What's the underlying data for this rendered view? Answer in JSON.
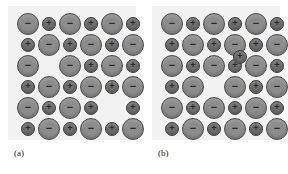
{
  "figure": {
    "background_color": "#ffffff",
    "panel_background_color": "#f2f2f2",
    "anion_color": "#8c8c8c",
    "anion_border_color": "#4a4a4a",
    "cation_color": "#6e6e6e",
    "cation_border_color": "#3d3d3d"
  },
  "legend": {
    "anion_symbol": "−",
    "cation_symbol": "+",
    "anion_name": "anion",
    "cation_name": "cation"
  },
  "panels": [
    {
      "caption": "(a)",
      "defect_type": "Schottky defect",
      "grid": {
        "columns": 6,
        "rows": 6,
        "x_start": 20,
        "x_step": 21,
        "y_start": 18,
        "y_step": 21
      },
      "vacancies": [
        {
          "row": 3,
          "col": 2,
          "missing": "cation"
        },
        {
          "row": 5,
          "col": 5,
          "missing": "anion"
        }
      ],
      "interstitials": [],
      "ions": [
        {
          "row": 1,
          "col": 1,
          "type": "anion",
          "sign": "−"
        },
        {
          "row": 1,
          "col": 2,
          "type": "cation",
          "sign": "+"
        },
        {
          "row": 1,
          "col": 3,
          "type": "anion",
          "sign": "−"
        },
        {
          "row": 1,
          "col": 4,
          "type": "cation",
          "sign": "+"
        },
        {
          "row": 1,
          "col": 5,
          "type": "anion",
          "sign": "−"
        },
        {
          "row": 1,
          "col": 6,
          "type": "cation",
          "sign": "+"
        },
        {
          "row": 2,
          "col": 1,
          "type": "cation",
          "sign": "+"
        },
        {
          "row": 2,
          "col": 2,
          "type": "anion",
          "sign": "−"
        },
        {
          "row": 2,
          "col": 3,
          "type": "cation",
          "sign": "+"
        },
        {
          "row": 2,
          "col": 4,
          "type": "anion",
          "sign": "−"
        },
        {
          "row": 2,
          "col": 5,
          "type": "cation",
          "sign": "+"
        },
        {
          "row": 2,
          "col": 6,
          "type": "anion",
          "sign": "−"
        },
        {
          "row": 3,
          "col": 1,
          "type": "anion",
          "sign": "−"
        },
        {
          "row": 3,
          "col": 3,
          "type": "anion",
          "sign": "−"
        },
        {
          "row": 3,
          "col": 4,
          "type": "cation",
          "sign": "+"
        },
        {
          "row": 3,
          "col": 5,
          "type": "anion",
          "sign": "−"
        },
        {
          "row": 3,
          "col": 6,
          "type": "cation",
          "sign": "+"
        },
        {
          "row": 4,
          "col": 1,
          "type": "cation",
          "sign": "+"
        },
        {
          "row": 4,
          "col": 2,
          "type": "anion",
          "sign": "−"
        },
        {
          "row": 4,
          "col": 3,
          "type": "cation",
          "sign": "+"
        },
        {
          "row": 4,
          "col": 4,
          "type": "anion",
          "sign": "−"
        },
        {
          "row": 4,
          "col": 5,
          "type": "cation",
          "sign": "+"
        },
        {
          "row": 4,
          "col": 6,
          "type": "anion",
          "sign": "−"
        },
        {
          "row": 5,
          "col": 1,
          "type": "anion",
          "sign": "−"
        },
        {
          "row": 5,
          "col": 2,
          "type": "cation",
          "sign": "+"
        },
        {
          "row": 5,
          "col": 3,
          "type": "anion",
          "sign": "−"
        },
        {
          "row": 5,
          "col": 4,
          "type": "cation",
          "sign": "+"
        },
        {
          "row": 5,
          "col": 6,
          "type": "cation",
          "sign": "+"
        },
        {
          "row": 6,
          "col": 1,
          "type": "cation",
          "sign": "+"
        },
        {
          "row": 6,
          "col": 2,
          "type": "anion",
          "sign": "−"
        },
        {
          "row": 6,
          "col": 3,
          "type": "cation",
          "sign": "+"
        },
        {
          "row": 6,
          "col": 4,
          "type": "anion",
          "sign": "−"
        },
        {
          "row": 6,
          "col": 5,
          "type": "cation",
          "sign": "+"
        },
        {
          "row": 6,
          "col": 6,
          "type": "anion",
          "sign": "−"
        }
      ]
    },
    {
      "caption": "(b)",
      "defect_type": "Frenkel defect",
      "grid": {
        "columns": 6,
        "rows": 6,
        "x_start": 20,
        "x_step": 21,
        "y_start": 18,
        "y_step": 21
      },
      "vacancies": [
        {
          "row": 4,
          "col": 3,
          "missing": "cation"
        }
      ],
      "interstitials": [
        {
          "type": "cation",
          "sign": "+",
          "x": 88,
          "y": 51
        }
      ],
      "ions": [
        {
          "row": 1,
          "col": 1,
          "type": "anion",
          "sign": "−"
        },
        {
          "row": 1,
          "col": 2,
          "type": "cation",
          "sign": "+"
        },
        {
          "row": 1,
          "col": 3,
          "type": "anion",
          "sign": "−"
        },
        {
          "row": 1,
          "col": 4,
          "type": "cation",
          "sign": "+"
        },
        {
          "row": 1,
          "col": 5,
          "type": "anion",
          "sign": "−"
        },
        {
          "row": 1,
          "col": 6,
          "type": "cation",
          "sign": "+"
        },
        {
          "row": 2,
          "col": 1,
          "type": "cation",
          "sign": "+"
        },
        {
          "row": 2,
          "col": 2,
          "type": "anion",
          "sign": "−"
        },
        {
          "row": 2,
          "col": 3,
          "type": "cation",
          "sign": "+"
        },
        {
          "row": 2,
          "col": 4,
          "type": "anion",
          "sign": "−"
        },
        {
          "row": 2,
          "col": 5,
          "type": "cation",
          "sign": "+"
        },
        {
          "row": 2,
          "col": 6,
          "type": "anion",
          "sign": "−"
        },
        {
          "row": 3,
          "col": 1,
          "type": "anion",
          "sign": "−"
        },
        {
          "row": 3,
          "col": 2,
          "type": "cation",
          "sign": "+"
        },
        {
          "row": 3,
          "col": 3,
          "type": "anion",
          "sign": "−"
        },
        {
          "row": 3,
          "col": 4,
          "type": "cation",
          "sign": "+"
        },
        {
          "row": 3,
          "col": 5,
          "type": "anion",
          "sign": "−"
        },
        {
          "row": 3,
          "col": 6,
          "type": "cation",
          "sign": "+"
        },
        {
          "row": 4,
          "col": 1,
          "type": "cation",
          "sign": "+"
        },
        {
          "row": 4,
          "col": 2,
          "type": "anion",
          "sign": "−"
        },
        {
          "row": 4,
          "col": 4,
          "type": "anion",
          "sign": "−"
        },
        {
          "row": 4,
          "col": 5,
          "type": "cation",
          "sign": "+"
        },
        {
          "row": 4,
          "col": 6,
          "type": "anion",
          "sign": "−"
        },
        {
          "row": 5,
          "col": 1,
          "type": "anion",
          "sign": "−"
        },
        {
          "row": 5,
          "col": 2,
          "type": "cation",
          "sign": "+"
        },
        {
          "row": 5,
          "col": 3,
          "type": "anion",
          "sign": "−"
        },
        {
          "row": 5,
          "col": 4,
          "type": "cation",
          "sign": "+"
        },
        {
          "row": 5,
          "col": 5,
          "type": "anion",
          "sign": "−"
        },
        {
          "row": 5,
          "col": 6,
          "type": "cation",
          "sign": "+"
        },
        {
          "row": 6,
          "col": 1,
          "type": "cation",
          "sign": "+"
        },
        {
          "row": 6,
          "col": 2,
          "type": "anion",
          "sign": "−"
        },
        {
          "row": 6,
          "col": 3,
          "type": "cation",
          "sign": "+"
        },
        {
          "row": 6,
          "col": 4,
          "type": "anion",
          "sign": "−"
        },
        {
          "row": 6,
          "col": 5,
          "type": "cation",
          "sign": "+"
        },
        {
          "row": 6,
          "col": 6,
          "type": "anion",
          "sign": "−"
        }
      ]
    }
  ]
}
